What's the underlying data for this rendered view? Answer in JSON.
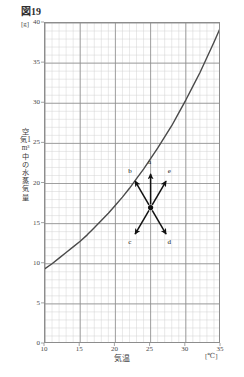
{
  "figure": {
    "title": "図19",
    "y_unit": "[g]",
    "y_axis_title": "空気1m³中の水蒸気量",
    "x_axis_title": "気温",
    "x_unit": "[℃]"
  },
  "chart_data": {
    "type": "line",
    "title": "図19",
    "xlabel": "気温",
    "ylabel": "空気1m³中の水蒸気量",
    "x_unit": "[℃]",
    "y_unit": "[g]",
    "xlim": [
      10,
      35
    ],
    "ylim": [
      0,
      40
    ],
    "x_ticks": [
      10,
      15,
      20,
      25,
      30,
      35
    ],
    "y_ticks": [
      0,
      5,
      10,
      15,
      20,
      25,
      30,
      35,
      40
    ],
    "grid": "minor 1-unit grid with major 5-unit gridlines",
    "legend": "none",
    "series": [
      {
        "name": "飽和水蒸気量",
        "x": [
          10,
          11,
          12,
          13,
          14,
          15,
          16,
          17,
          18,
          19,
          20,
          21,
          22,
          23,
          24,
          25,
          26,
          27,
          28,
          29,
          30,
          31,
          32,
          33,
          34,
          35
        ],
        "values": [
          9.4,
          10.0,
          10.7,
          11.4,
          12.1,
          12.8,
          13.6,
          14.5,
          15.4,
          16.3,
          17.3,
          18.3,
          19.4,
          20.6,
          21.8,
          23.1,
          24.4,
          25.8,
          27.2,
          28.8,
          30.4,
          32.1,
          33.8,
          35.7,
          37.6,
          39.6
        ]
      }
    ],
    "annotations": {
      "type": "arrow-diagram",
      "origin": {
        "x": 25.0,
        "y": 17.0,
        "marker": "filled-dot"
      },
      "arrows": [
        {
          "label": "a",
          "direction": "up",
          "tip_x": 25.0,
          "tip_y": 21.2,
          "label_x": 25.0,
          "label_y": 22.6
        },
        {
          "label": "b",
          "direction": "upper-left",
          "tip_x": 22.8,
          "tip_y": 20.3,
          "label_x": 22.2,
          "label_y": 21.4
        },
        {
          "label": "e",
          "direction": "upper-right",
          "tip_x": 27.2,
          "tip_y": 20.3,
          "label_x": 27.8,
          "label_y": 21.4
        },
        {
          "label": "c",
          "direction": "lower-left",
          "tip_x": 22.8,
          "tip_y": 13.7,
          "label_x": 22.2,
          "label_y": 12.6
        },
        {
          "label": "d",
          "direction": "lower-right",
          "tip_x": 27.2,
          "tip_y": 13.7,
          "label_x": 27.8,
          "label_y": 12.6
        }
      ]
    },
    "colors": {
      "curve": "#4a4a4a",
      "major_grid": "#8d8d8d",
      "minor_grid": "#d2d2d2",
      "frame": "#8d8d8d",
      "arrow": "#111111",
      "text": "#3a3a3a"
    }
  }
}
